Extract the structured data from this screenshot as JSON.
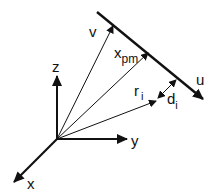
{
  "diagram": {
    "type": "vector-geometry",
    "colors": {
      "stroke": "#111111",
      "background": "#ffffff"
    },
    "labels": {
      "z": "z",
      "y": "y",
      "x": "x",
      "v": "v",
      "x_pm_base": "x",
      "x_pm_sub": "pm",
      "u": "u",
      "r_base": "r",
      "r_sub": "i",
      "d_base": "d",
      "d_sub": "i"
    }
  }
}
